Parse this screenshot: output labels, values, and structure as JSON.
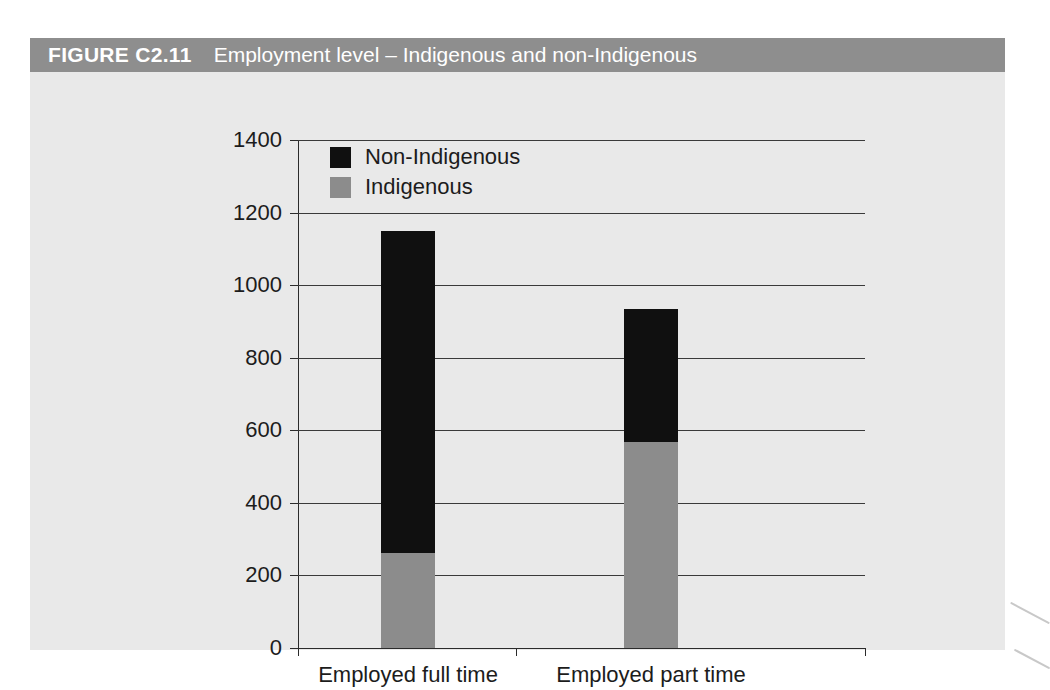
{
  "figure": {
    "number": "FIGURE C2.11",
    "caption": "Employment level – Indigenous and non-Indigenous"
  },
  "colors": {
    "indigenous": "#8c8c8c",
    "non_indigenous": "#101010",
    "titlebar": "#8e8e8e",
    "card_background": "#e9e9e9",
    "axis": "#2b2b2b",
    "gridline": "#3a3a3a",
    "title_text": "#ffffff",
    "tick_text": "#1c1c1c"
  },
  "chart_data": {
    "type": "bar",
    "stacked": true,
    "title": "Employment level – Indigenous and non-Indigenous",
    "xlabel": "",
    "ylabel": "",
    "categories": [
      "Employed full time",
      "Employed part time"
    ],
    "series": [
      {
        "name": "Indigenous",
        "values": [
          261,
          567
        ],
        "color": "#8c8c8c"
      },
      {
        "name": "Non-Indigenous",
        "values": [
          889,
          367
        ],
        "color": "#101010"
      }
    ],
    "totals": [
      1150,
      934
    ],
    "ylim": [
      0,
      1400
    ],
    "ytick_step": 200,
    "yticks": [
      1400,
      1200,
      1000,
      800,
      600,
      400,
      200,
      0
    ],
    "ytick_labels": [
      "1400",
      "1200",
      "1000",
      "800",
      "600",
      "400",
      "200",
      "0"
    ],
    "grid": true,
    "grid_axis": "y",
    "legend_position": "top-left-inside",
    "legend_order": [
      "Non-Indigenous",
      "Indigenous"
    ]
  }
}
